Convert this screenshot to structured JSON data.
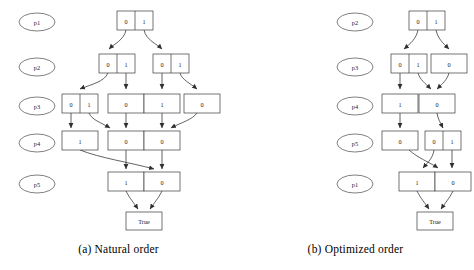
{
  "figures": [
    {
      "id": "natural-order",
      "caption": "(a) Natural order",
      "variable_labels": [
        "p1",
        "p2",
        "p3",
        "p4",
        "p5"
      ],
      "terminal_label": "True",
      "levels": [
        {
          "label": "p1",
          "nodes": [
            {
              "cells": [
                "0",
                "1"
              ]
            }
          ]
        },
        {
          "label": "p2",
          "nodes": [
            {
              "cells": [
                "0",
                "1"
              ]
            },
            {
              "cells": [
                "0",
                "1"
              ]
            }
          ]
        },
        {
          "label": "p3",
          "nodes": [
            {
              "cells": [
                "0",
                "1"
              ]
            },
            {
              "cells": [
                "0"
              ]
            },
            {
              "cells": [
                "1"
              ]
            },
            {
              "cells": [
                "0"
              ]
            }
          ]
        },
        {
          "label": "p4",
          "nodes": [
            {
              "cells": [
                "1"
              ]
            },
            {
              "cells": [
                "0"
              ]
            },
            {
              "cells": [
                "0"
              ]
            }
          ]
        },
        {
          "label": "p5",
          "nodes": [
            {
              "cells": [
                "1"
              ]
            },
            {
              "cells": [
                "0"
              ]
            }
          ]
        }
      ]
    },
    {
      "id": "optimized-order",
      "caption": "(b) Optimized order",
      "variable_labels": [
        "p2",
        "p3",
        "p4",
        "p5",
        "p1"
      ],
      "terminal_label": "True",
      "levels": [
        {
          "label": "p2",
          "nodes": [
            {
              "cells": [
                "0",
                "1"
              ]
            }
          ]
        },
        {
          "label": "p3",
          "nodes": [
            {
              "cells": [
                "0",
                "1"
              ]
            },
            {
              "cells": [
                "0"
              ]
            }
          ]
        },
        {
          "label": "p4",
          "nodes": [
            {
              "cells": [
                "1"
              ]
            },
            {
              "cells": [
                "0"
              ]
            }
          ]
        },
        {
          "label": "p5",
          "nodes": [
            {
              "cells": [
                "0"
              ]
            },
            {
              "cells": [
                "0",
                "1"
              ]
            }
          ]
        },
        {
          "label": "p1",
          "nodes": [
            {
              "cells": [
                "1"
              ]
            },
            {
              "cells": [
                "0"
              ]
            }
          ]
        }
      ]
    }
  ],
  "colors": {
    "background": "#ffffff",
    "stroke": "#3a3a3a",
    "edge": "#2f2f2f",
    "text": "#1a1a1a"
  }
}
